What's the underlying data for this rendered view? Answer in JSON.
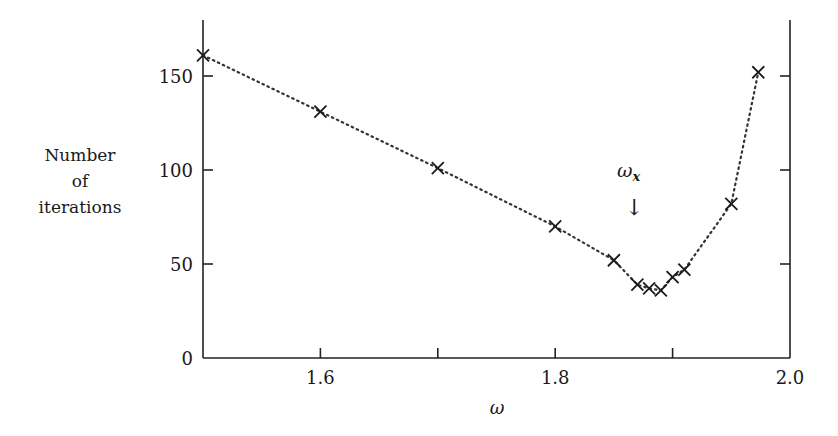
{
  "chart_data": {
    "type": "line",
    "title": "",
    "xlabel": "ω",
    "ylabel": "Number of iterations",
    "ylabel_lines": [
      "Number",
      "of",
      "iterations"
    ],
    "xlim": [
      1.5,
      2.0
    ],
    "ylim": [
      0,
      175
    ],
    "xticks": [
      1.6,
      1.7,
      1.8,
      1.9,
      2.0
    ],
    "xtick_labels": [
      "1.6",
      "",
      "1.8",
      "",
      "2.0"
    ],
    "yticks": [
      0,
      50,
      100,
      150
    ],
    "ytick_labels": [
      "0",
      "50",
      "100",
      "150"
    ],
    "grid": false,
    "legend": null,
    "marker": "x",
    "line_style": "dotted",
    "series": [
      {
        "name": "iterations",
        "x": [
          1.5,
          1.6,
          1.7,
          1.8,
          1.85,
          1.87,
          1.88,
          1.89,
          1.9,
          1.91,
          1.95,
          1.973
        ],
        "y": [
          161,
          131,
          101,
          70,
          52,
          39,
          37,
          36,
          43,
          47,
          82,
          152
        ]
      }
    ],
    "annotations": [
      {
        "text": "ω_x",
        "display": "ωx",
        "x": 1.87,
        "y": 100,
        "arrow": "down"
      }
    ]
  },
  "labels": {
    "xlabel": "ω",
    "ylabel_line1": "Number",
    "ylabel_line2": "of",
    "ylabel_line3": "iterations",
    "annotation_main": "ω",
    "annotation_sub": "x",
    "annotation_arrow": "↓"
  }
}
